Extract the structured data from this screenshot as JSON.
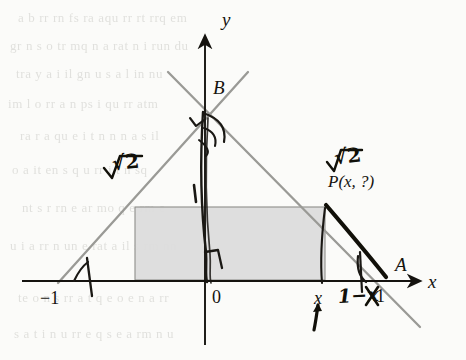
{
  "figure": {
    "kind": "geometry-diagram",
    "background_color": "#fbfbf9",
    "line_color": "#9a9a96",
    "ink_color": "#15130f",
    "pencil_color": "#111009",
    "rect_fill": "#dcdcdc",
    "rect_stroke": "#8e8e8a"
  },
  "axes": {
    "x_label": "x",
    "y_label": "y",
    "origin_label": "0"
  },
  "ticks": [
    {
      "name": "left-intercept",
      "label": "−1"
    },
    {
      "name": "origin",
      "label": "0"
    },
    {
      "name": "x-tick",
      "label": "x"
    },
    {
      "name": "one-tick",
      "label": "1"
    }
  ],
  "points": [
    {
      "name": "apex",
      "label": "B"
    },
    {
      "name": "right-intercept",
      "label": "A"
    },
    {
      "name": "point-on-leg",
      "label": "P(x, ?)"
    }
  ],
  "annotations": [
    {
      "name": "sqrt2-left",
      "text": "√2"
    },
    {
      "name": "sqrt2-right",
      "text": "√2"
    },
    {
      "name": "one-minus-x",
      "text": "1−x"
    }
  ],
  "bleed_text": [
    "a   b   rr  rn fs  ra  aqu  rr  rt  rrq  em",
    "gr   n   s  o   tr  mq  n  a   rat n i  run  du",
    "tra   y  a  i   il  gn  u   s   a l  in  nu",
    "im  l   o   rr   a   n   ps   i   qu   rr  atm",
    "ra   r  a   qu  e  i  t  n  n  n  a   s   il",
    "o   a   it  en   s   q  u   rr  i   t  n   sq",
    "nt   s  r  rn  e    ar   mo  q  e  rm  e",
    "u  i  a  rr   n  un  e  rat  a  il  s  rm  nn",
    "te   o  n  s  rr  a  t   q  e  o  e  n  a  rr",
    "s  a  t  i  n  u  rr  e  q   s  e  a  rm  n  u"
  ]
}
